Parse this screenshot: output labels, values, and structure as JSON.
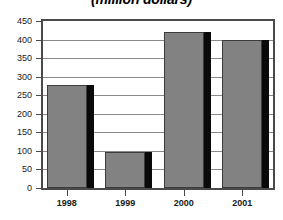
{
  "chart_data": {
    "type": "bar",
    "title": "(million dollars)",
    "xlabel": "",
    "ylabel": "",
    "categories": [
      "1998",
      "1999",
      "2000",
      "2001"
    ],
    "values": [
      278,
      97,
      420,
      398
    ],
    "ylim": [
      0,
      450
    ],
    "yticks": [
      0,
      50,
      100,
      150,
      200,
      250,
      300,
      350,
      400,
      450
    ],
    "ytick_labels": [
      "0",
      "50",
      "100",
      "150",
      "200",
      "250",
      "300",
      "350",
      "400",
      "450"
    ],
    "grid": true,
    "legend": null,
    "series": [
      {
        "name": "",
        "values": [
          278,
          97,
          420,
          398
        ]
      }
    ],
    "colors": {
      "bar_fill": "#828282",
      "bar_shadow": "#0a0a0a",
      "bar_outline": "#3c3c3c",
      "gridline": "#8a8a8a",
      "axis": "#4a4a4a",
      "text": "#1a1a1a",
      "background": "#ffffff"
    }
  }
}
